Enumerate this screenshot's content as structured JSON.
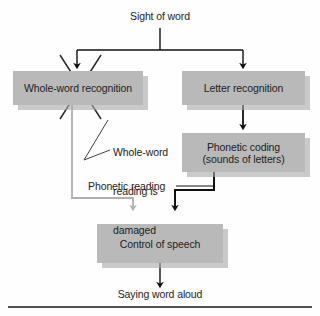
{
  "diagram": {
    "title": "Sight of word",
    "colors": {
      "box_fill": "#b9b9b9",
      "box_shadow": "#aaaaaa",
      "text": "#1d1d1d",
      "arrow_black": "#111111",
      "arrow_gray": "#b0b0b0",
      "rule": "#4e5256",
      "background": "#fefefe"
    },
    "labels": {
      "sight_of_word": "Sight of word",
      "whole_word_recognition": "Whole-word recognition",
      "letter_recognition": "Letter recognition",
      "phonetic_coding_line1": "Phonetic coding",
      "phonetic_coding_line2": "(sounds of letters)",
      "damaged_line1": "Whole-word",
      "damaged_line2": "reading is",
      "damaged_line3": "damaged",
      "phonetic_reading": "Phonetic reading",
      "control_of_speech": "Control of speech",
      "saying_word_aloud": "Saying word aloud"
    },
    "annotations": {
      "cross_out": "X mark over Whole-word recognition",
      "leader_line": "pointer from damaged caption to the X"
    }
  }
}
